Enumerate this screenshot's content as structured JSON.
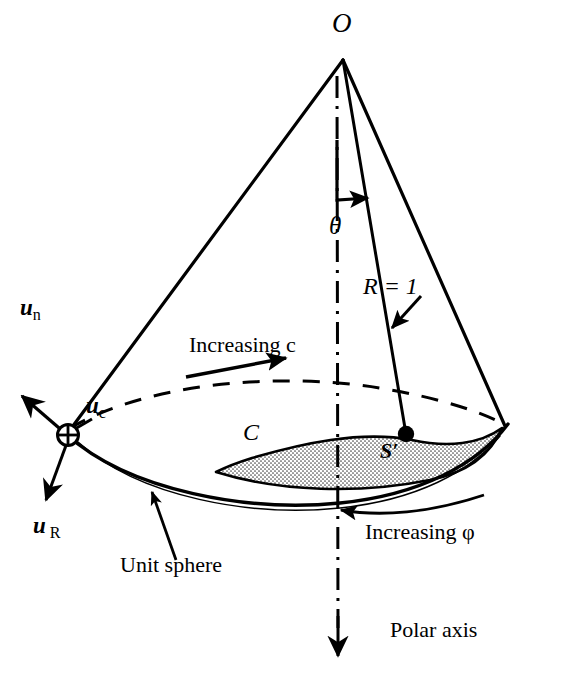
{
  "figure": {
    "width": 563,
    "height": 686,
    "background_color": "#ffffff",
    "ink_color": "#000000",
    "cap_fill_color": "#d8d8d8"
  },
  "labels": {
    "apex": "O",
    "theta": "θ",
    "radius": "R = 1",
    "u_n": "u",
    "u_n_sub": "n",
    "u_c": "u",
    "u_c_sub": "c",
    "u_R": "u",
    "u_R_sub": "R",
    "increasing_c": "Increasing  c",
    "contour_C": "C",
    "surface_S_prime": "S′",
    "increasing_phi": "Increasing φ",
    "unit_sphere": "Unit sphere",
    "polar_axis": "Polar axis"
  },
  "geometry": {
    "apex_point": [
      343,
      58
    ],
    "cone_left_base": [
      68,
      435
    ],
    "cone_right_base": [
      500,
      424
    ],
    "polar_axis_top": [
      336,
      78
    ],
    "polar_axis_bottom": [
      338,
      648
    ],
    "radial_line_end": [
      405,
      434
    ],
    "cap_marker_point": [
      405,
      434
    ],
    "circle_plus_point": [
      68,
      435
    ]
  },
  "annotations": [
    {
      "name": "theta-angle-arc",
      "text": "θ",
      "description": "polar angle measured from polar axis to radial line"
    },
    {
      "name": "radius-leader",
      "text": "R = 1",
      "description": "arrow pointing to unit radial line"
    },
    {
      "name": "increasing-c-arrow",
      "text": "Increasing  c",
      "description": "straight arrow pointing right along dashed ellipse"
    },
    {
      "name": "increasing-phi-arrow",
      "text": "Increasing φ",
      "description": "curved arrow pointing left beneath spherical cap"
    },
    {
      "name": "unit-sphere-leader",
      "text": "Unit sphere",
      "description": "leader arrow pointing up to sphere surface arc"
    },
    {
      "name": "polar-axis-arrow",
      "text": "Polar axis",
      "description": "downward arrowhead terminating dash-dot axis"
    }
  ]
}
